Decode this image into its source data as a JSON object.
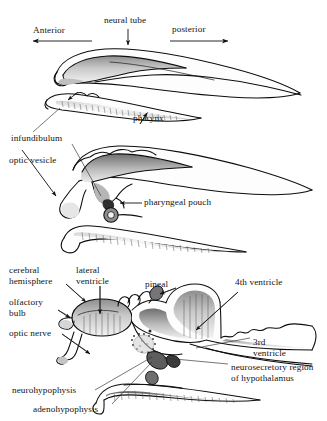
{
  "figure": {
    "style": "black-and-white pen-and-ink biological illustration, three stacked sagittal stages",
    "stroke_color": "#0d0d0d",
    "shade_color": "#9c9c9c",
    "background_color": "#ffffff"
  },
  "panels": [
    {
      "id": "panel-early-stage",
      "name": "early neurula stage",
      "labels": [
        "Anterior",
        "neural tube",
        "posterior",
        "infundibulum",
        "pharynx"
      ]
    },
    {
      "id": "panel-mid-stage",
      "name": "optic vesicle stage",
      "labels": [
        "infundibulum",
        "optic vesicle",
        "pharyngeal pouch"
      ]
    },
    {
      "id": "panel-late-stage",
      "name": "differentiated brain stage",
      "labels": [
        "cerebral hemisphere",
        "lateral ventricle",
        "pineal",
        "4th ventricle",
        "olfactory bulb",
        "optic nerve",
        "3rd ventricle",
        "neurosecretory region of hypothalamus",
        "neurohypophysis",
        "adenohypophysis"
      ]
    }
  ],
  "labels": {
    "anterior": "Anterior",
    "neural_tube": "neural tube",
    "posterior": "posterior",
    "pharynx": "pharynx",
    "infundibulum": "infundibulum",
    "optic_vesicle": "optic vesicle",
    "pharyngeal_pouch": "pharyngeal pouch",
    "cerebral_hemisphere_line1": "cerebral",
    "cerebral_hemisphere_line2": "hemisphere",
    "lateral_ventricle_line1": "lateral",
    "lateral_ventricle_line2": "ventricle",
    "pineal": "pineal",
    "fourth_ventricle": "4th ventricle",
    "olfactory_bulb_line1": "olfactory",
    "olfactory_bulb_line2": "bulb",
    "optic_nerve": "optic nerve",
    "third_ventricle_line1": "3rd",
    "third_ventricle_line2": "ventricle",
    "neurosecretory_line1": "neurosecretory region",
    "neurosecretory_line2": "of hypothalamus",
    "neurohypophysis": "neurohypophysis",
    "adenohypophysis": "adenohypophysis"
  },
  "direction_arrows": {
    "anterior_direction": "left",
    "posterior_direction": "right"
  }
}
